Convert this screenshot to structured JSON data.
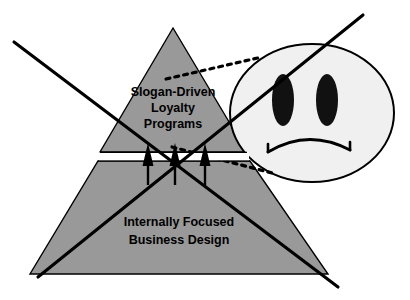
{
  "diagram": {
    "type": "concept-diagram",
    "canvas": {
      "width": 410,
      "height": 300,
      "background": "#ffffff"
    },
    "colors": {
      "pyramid_fill": "#999999",
      "stroke": "#000000",
      "face_fill": "#f0f0f0",
      "background": "#ffffff",
      "gap_fill": "#ffffff"
    },
    "pyramid": {
      "upper": {
        "name": "Slogan-Driven Loyalty Programs",
        "lines": [
          "Slogan-Driven",
          "Loyalty",
          "Programs"
        ],
        "fill": "#999999",
        "apex": [
          173,
          28
        ],
        "base_left": [
          100,
          152
        ],
        "base_right": [
          247,
          152
        ]
      },
      "lower": {
        "name": "Internally Focused Business Design",
        "lines": [
          "Internally Focused",
          "Business Design"
        ],
        "fill": "#999999",
        "top_left": [
          98,
          161
        ],
        "top_right": [
          250,
          161
        ],
        "base_left": [
          30,
          274
        ],
        "base_right": [
          328,
          274
        ]
      },
      "gap": {
        "top": 152,
        "bottom": 161,
        "fill": "#ffffff"
      }
    },
    "arrows": {
      "name": "upward-pressure-arrows",
      "count": 3,
      "direction": "up",
      "color": "#000000",
      "positions": [
        148,
        175,
        205
      ],
      "tail_y": 185,
      "tip_y": 143
    },
    "cross": {
      "name": "cancellation-cross",
      "color": "#000000",
      "stroke_width": 3,
      "lines": [
        {
          "name": "descending",
          "x1": 14,
          "y1": 42,
          "x2": 338,
          "y2": 287
        },
        {
          "name": "ascending",
          "x1": 38,
          "y1": 277,
          "x2": 363,
          "y2": 15
        }
      ]
    },
    "face": {
      "name": "unhappy-customer-face",
      "expression": "frowning",
      "fill": "#f0f0f0",
      "stroke": "#000000",
      "center": [
        312,
        113
      ],
      "radius_x": 82,
      "radius_y": 69,
      "eyes": [
        {
          "name": "left-eye",
          "cx": 283,
          "cy": 100,
          "rx": 11,
          "ry": 26
        },
        {
          "name": "right-eye",
          "cx": 327,
          "cy": 100,
          "rx": 11,
          "ry": 26
        }
      ],
      "mouth": {
        "name": "frown-mouth",
        "type": "downturned-arc"
      }
    },
    "leaders": [
      {
        "name": "upper-leader-line",
        "style": "dotted",
        "from": [
          166,
          79
        ],
        "to": [
          262,
          57
        ]
      },
      {
        "name": "lower-leader-line",
        "style": "dotted",
        "from": [
          172,
          147
        ],
        "to": [
          272,
          173
        ]
      }
    ]
  }
}
